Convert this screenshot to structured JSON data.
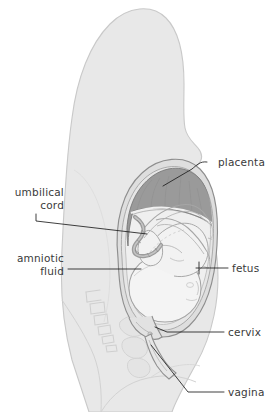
{
  "figure": {
    "view": "side (sagittal) section",
    "background_color": "#ffffff"
  },
  "colors": {
    "body_fill": "#e8e8e8",
    "body_stroke": "#c6c6c6",
    "uterus_wall": "#dedede",
    "uterus_stroke": "#8c8c8c",
    "amniotic_fluid": "#efefef",
    "placenta_fill": "#9a9a9a",
    "placenta_stroke": "#7a7a7a",
    "fetus_fill": "#f2f2f2",
    "fetus_stroke": "#a6a6a6",
    "fetal_head_fill": "#f4f4f4",
    "cord_fill": "#a8a8a8",
    "bone_fill": "#e2e2e2",
    "bone_stroke": "#cccccc",
    "leader_line": "#1d1d1d",
    "label_text": "#3a3a3a"
  },
  "labels": [
    {
      "id": "placenta",
      "text": "placenta",
      "side": "right",
      "text_x": 218,
      "text_y": 166,
      "leader": "M 207 162 C 200 161 197 165 192 169 L 163 186"
    },
    {
      "id": "umbilical-cord",
      "text_line1": "umbilical",
      "text_line2": "cord",
      "side": "left",
      "text_x": 64,
      "text_y": 196,
      "text_y2": 209,
      "leader": "M 36 214 L 36 221 L 147 234"
    },
    {
      "id": "amniotic-fluid",
      "text_line1": "amniotic",
      "text_line2": "fluid",
      "side": "left",
      "text_x": 64,
      "text_y": 262,
      "text_y2": 275,
      "leader": "M 68 269 L 141 269"
    },
    {
      "id": "fetus",
      "text": "fetus",
      "side": "right",
      "text_x": 232,
      "text_y": 272,
      "leader": "M 228 268 L 196 268 M 199 262 L 199 274"
    },
    {
      "id": "cervix",
      "text": "cervix",
      "side": "right",
      "text_x": 228,
      "text_y": 336,
      "leader": "M 224 332 L 167 332 L 155 327"
    },
    {
      "id": "vagina",
      "text": "vagina",
      "side": "right",
      "text_x": 228,
      "text_y": 396,
      "leader": "M 224 392 L 188 392 L 151 345"
    }
  ],
  "structures": [
    {
      "id": "maternal-body",
      "name": "maternal torso silhouette"
    },
    {
      "id": "uterus",
      "name": "uterus"
    },
    {
      "id": "placenta",
      "name": "placenta"
    },
    {
      "id": "amniotic-sac",
      "name": "amniotic sac and fluid"
    },
    {
      "id": "fetus",
      "name": "fetus in cephalic presentation"
    },
    {
      "id": "fetal-head",
      "name": "fetal head"
    },
    {
      "id": "umbilical-cord",
      "name": "umbilical cord"
    },
    {
      "id": "cervix",
      "name": "cervix"
    },
    {
      "id": "vagina",
      "name": "vaginal canal"
    },
    {
      "id": "sacrum",
      "name": "sacrum and coccyx vertebrae"
    },
    {
      "id": "pubic-bone",
      "name": "pubic symphysis"
    }
  ]
}
